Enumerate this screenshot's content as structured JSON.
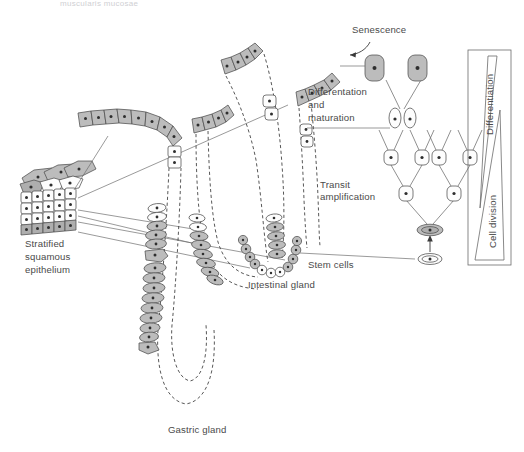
{
  "figure": {
    "title_partial": "muscularis mucosae",
    "background": "#ffffff",
    "ink": "#4a4a4a",
    "cell_fill_gray": "#bcbcbc",
    "cell_fill_white": "#fdfdfd",
    "cell_stroke": "#4d4d4d"
  },
  "labels": {
    "stratified_squamous_epithelium": {
      "line1": "Stratified",
      "line2": "squamous",
      "line3": "epithelium"
    },
    "gastric_gland": "Gastric gland",
    "intestinal_gland": "Intestinal gland",
    "stem_cells": "Stem cells",
    "transit_amplification": {
      "line1": "Transit",
      "line2": "amplification"
    },
    "differentiation_and_maturation": {
      "line1": "Differentation",
      "line2": "and",
      "line3": "maturation"
    },
    "senescence": "Senescence",
    "differentiation_axis": "Differentiation",
    "cell_division_axis": "Cell division"
  },
  "structures": {
    "stratified_block": {
      "name": "stratified squamous epithelium block",
      "layers": 4,
      "columns": 5
    },
    "gastric_gland": {
      "name": "gastric gland",
      "shape": "long looped tube with dashed lumen"
    },
    "intestinal_gland": {
      "name": "intestinal gland",
      "shape": "crypt with U-shaped base"
    },
    "lineage_tree": {
      "name": "cell lineage tree",
      "tiers": [
        {
          "tier": "stem cell",
          "count": 1,
          "shape": "flat oval",
          "fill": "white"
        },
        {
          "tier": "activated stem cell",
          "count": 1,
          "shape": "flat oval",
          "fill": "gray"
        },
        {
          "tier": "transit amplifying",
          "count": 2,
          "shape": "rounded rect",
          "fill": "white"
        },
        {
          "tier": "transit amplifying",
          "count": 4,
          "shape": "rounded rect",
          "fill": "white"
        },
        {
          "tier": "maturing",
          "count": 2,
          "shape": "tall oval",
          "fill": "white"
        },
        {
          "tier": "senescent",
          "count": 2,
          "shape": "rounded rect",
          "fill": "gray"
        }
      ]
    }
  }
}
